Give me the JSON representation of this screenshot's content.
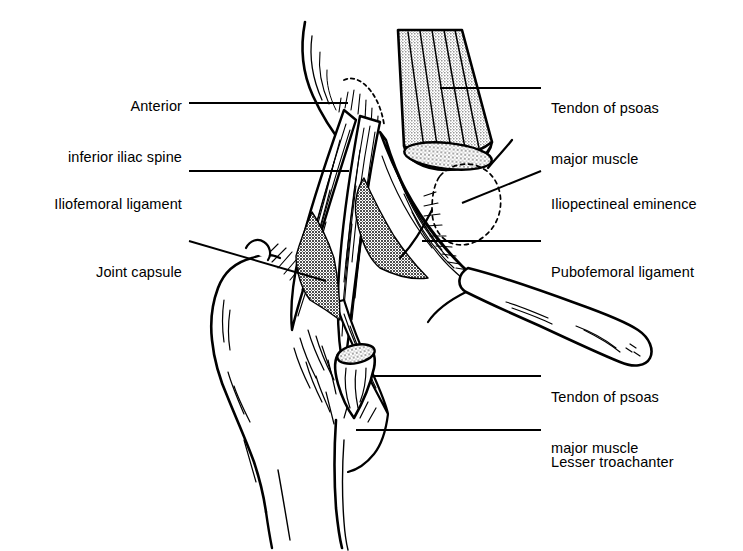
{
  "figure": {
    "type": "anatomical-line-diagram",
    "background_color": "#ffffff",
    "ink_color": "#000000",
    "shade_fill_color": "#808080",
    "stipple_fill_color": "#b0b0b0"
  },
  "labels": {
    "anterior_inferior_iliac_spine": {
      "line1": "Anterior",
      "line2": "inferior iliac spine",
      "side": "left"
    },
    "iliofemoral_ligament": {
      "line1": "Iliofemoral ligament",
      "side": "left"
    },
    "joint_capsule": {
      "line1": "Joint capsule",
      "side": "left"
    },
    "tendon_psoas_upper": {
      "line1": "Tendon of psoas",
      "line2": "major muscle",
      "side": "right"
    },
    "iliopectineal_eminence": {
      "line1": "Iliopectineal eminence",
      "side": "right"
    },
    "pubofemoral_ligament": {
      "line1": "Pubofemoral ligament",
      "side": "right"
    },
    "tendon_psoas_lower": {
      "line1": "Tendon of psoas",
      "line2": "major muscle",
      "side": "right"
    },
    "lesser_trochanter": {
      "line1": "Lesser troachanter",
      "side": "right"
    }
  },
  "structures": [
    {
      "name": "ilium",
      "label_ref": "anterior_inferior_iliac_spine"
    },
    {
      "name": "psoas-major-tendon-upper",
      "label_ref": "tendon_psoas_upper"
    },
    {
      "name": "iliofemoral-ligament",
      "label_ref": "iliofemoral_ligament"
    },
    {
      "name": "iliopectineal-eminence",
      "label_ref": "iliopectineal_eminence"
    },
    {
      "name": "joint-capsule",
      "label_ref": "joint_capsule"
    },
    {
      "name": "pubofemoral-ligament",
      "label_ref": "pubofemoral_ligament"
    },
    {
      "name": "greater-trochanter",
      "label_ref": null
    },
    {
      "name": "femur-shaft",
      "label_ref": null
    },
    {
      "name": "superior-pubic-ramus",
      "label_ref": null
    },
    {
      "name": "psoas-major-tendon-stump",
      "label_ref": "tendon_psoas_lower"
    },
    {
      "name": "lesser-trochanter",
      "label_ref": "lesser_trochanter"
    }
  ]
}
